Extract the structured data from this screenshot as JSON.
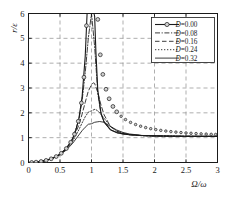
{
  "chart_data": {
    "type": "line",
    "title": "",
    "xlabel": "Ω/ω",
    "ylabel": "r/ε",
    "xlim": [
      0,
      3
    ],
    "ylim": [
      0,
      6
    ],
    "xticks": [
      "0",
      "0.5",
      "1",
      "1.5",
      "2",
      "2.5",
      "3"
    ],
    "xtick_values": [
      0,
      0.5,
      1,
      1.5,
      2,
      2.5,
      3
    ],
    "yticks": [
      "0",
      "1",
      "2",
      "3",
      "4",
      "5",
      "6"
    ],
    "ytick_values": [
      0,
      1,
      2,
      3,
      4,
      5,
      6
    ],
    "grid": true,
    "grid_style": "dashed",
    "legend_position": "top-right",
    "formula": "r/eps = beta^2 / sqrt((1-beta^2)^2 + (2*D*beta)^2)",
    "series": [
      {
        "name": "D=0.00",
        "damping": 0.0,
        "style": "solid-with-circle-markers",
        "marker": "circle",
        "peak_x": 1.0,
        "peak_y": 6.0,
        "x": [
          0.0,
          0.1,
          0.2,
          0.3,
          0.4,
          0.5,
          0.6,
          0.7,
          0.75,
          0.8,
          0.85,
          0.9,
          0.93,
          0.95,
          0.96,
          0.97,
          1.03,
          1.04,
          1.05,
          1.07,
          1.1,
          1.15,
          1.2,
          1.3,
          1.4,
          1.5,
          1.6,
          1.8,
          2.0,
          2.2,
          2.5,
          2.8,
          3.0
        ],
        "values": [
          0.0,
          0.01,
          0.042,
          0.099,
          0.19,
          0.333,
          0.563,
          0.961,
          1.286,
          1.778,
          2.62,
          4.263,
          6.0,
          6.0,
          6.0,
          6.0,
          6.0,
          6.0,
          5.88,
          4.45,
          2.905,
          2.001,
          1.636,
          1.322,
          1.204,
          1.154,
          1.119,
          1.086,
          1.073,
          1.066,
          1.059,
          1.055,
          1.053
        ]
      },
      {
        "name": "D=0.08",
        "damping": 0.08,
        "style": "dash-dot",
        "peak_x": 1.006,
        "peak_y": 6.0,
        "x": [
          0.0,
          0.1,
          0.2,
          0.3,
          0.4,
          0.5,
          0.6,
          0.7,
          0.8,
          0.85,
          0.9,
          0.95,
          1.0,
          1.05,
          1.1,
          1.15,
          1.2,
          1.3,
          1.4,
          1.5,
          1.6,
          1.8,
          2.0,
          2.2,
          2.5,
          2.8,
          3.0
        ],
        "values": [
          0.0,
          0.01,
          0.042,
          0.099,
          0.19,
          0.332,
          0.56,
          0.951,
          1.731,
          2.466,
          3.6,
          5.02,
          6.0,
          4.66,
          2.79,
          1.96,
          1.62,
          1.317,
          1.202,
          1.152,
          1.118,
          1.085,
          1.072,
          1.065,
          1.059,
          1.055,
          1.053
        ]
      },
      {
        "name": "D=0.16",
        "damping": 0.16,
        "style": "dashed",
        "peak_x": 1.027,
        "peak_y": 3.21,
        "x": [
          0.0,
          0.1,
          0.2,
          0.3,
          0.4,
          0.5,
          0.6,
          0.7,
          0.8,
          0.85,
          0.9,
          0.95,
          1.0,
          1.03,
          1.05,
          1.1,
          1.15,
          1.2,
          1.3,
          1.4,
          1.5,
          1.6,
          1.8,
          2.0,
          2.2,
          2.5,
          2.8,
          3.0
        ],
        "values": [
          0.0,
          0.01,
          0.042,
          0.099,
          0.189,
          0.329,
          0.549,
          0.909,
          1.51,
          1.94,
          2.42,
          2.88,
          3.13,
          3.21,
          3.18,
          2.82,
          2.32,
          1.92,
          1.45,
          1.26,
          1.17,
          1.12,
          1.08,
          1.07,
          1.06,
          1.055,
          1.05,
          1.05
        ]
      },
      {
        "name": "D=0.24",
        "damping": 0.24,
        "style": "dotted",
        "peak_x": 1.063,
        "peak_y": 2.14,
        "x": [
          0.0,
          0.1,
          0.2,
          0.3,
          0.4,
          0.5,
          0.6,
          0.7,
          0.8,
          0.85,
          0.9,
          0.95,
          1.0,
          1.05,
          1.06,
          1.1,
          1.15,
          1.2,
          1.3,
          1.4,
          1.5,
          1.6,
          1.8,
          2.0,
          2.2,
          2.5,
          2.8,
          3.0
        ],
        "values": [
          0.0,
          0.01,
          0.042,
          0.098,
          0.188,
          0.323,
          0.531,
          0.851,
          1.32,
          1.59,
          1.84,
          2.03,
          2.08,
          2.14,
          2.14,
          2.08,
          1.94,
          1.78,
          1.46,
          1.28,
          1.18,
          1.13,
          1.08,
          1.07,
          1.06,
          1.055,
          1.05,
          1.05
        ]
      },
      {
        "name": "D=0.32",
        "damping": 0.32,
        "style": "solid-thin",
        "peak_x": 1.125,
        "peak_y": 1.65,
        "x": [
          0.0,
          0.1,
          0.2,
          0.3,
          0.4,
          0.5,
          0.6,
          0.7,
          0.8,
          0.85,
          0.9,
          0.95,
          1.0,
          1.05,
          1.1,
          1.13,
          1.2,
          1.3,
          1.4,
          1.5,
          1.6,
          1.8,
          2.0,
          2.2,
          2.5,
          2.8,
          3.0
        ],
        "values": [
          0.0,
          0.01,
          0.041,
          0.097,
          0.184,
          0.312,
          0.5,
          0.769,
          1.11,
          1.28,
          1.42,
          1.54,
          1.56,
          1.62,
          1.64,
          1.65,
          1.62,
          1.45,
          1.31,
          1.21,
          1.15,
          1.09,
          1.07,
          1.06,
          1.05,
          1.05,
          1.05
        ]
      }
    ]
  },
  "legend": {
    "entries": [
      {
        "label": "D=0.00",
        "symbol_prefix": "D",
        "value": "=0.00"
      },
      {
        "label": "D=0.08",
        "symbol_prefix": "D",
        "value": "=0.08"
      },
      {
        "label": "D=0.16",
        "symbol_prefix": "D",
        "value": "=0.16"
      },
      {
        "label": "D=0.24",
        "symbol_prefix": "D",
        "value": "=0.24"
      },
      {
        "label": "D=0.32",
        "symbol_prefix": "D",
        "value": "=0.32"
      }
    ]
  },
  "axes": {
    "y_label_text": "r/ε",
    "x_label_text": "Ω/ω"
  },
  "colors": {
    "line": "#1a1a1a",
    "grid": "#8d8d8d",
    "frame": "#1a1a1a",
    "background": "#ffffff",
    "marker_fill": "#d0d0d0"
  }
}
